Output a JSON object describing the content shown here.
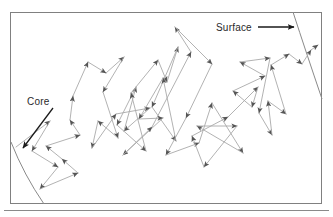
{
  "figure": {
    "title": "",
    "caption": "",
    "type": "random-walk-diagram",
    "background_color": "#ffffff",
    "frame": {
      "name": "outer-frame",
      "x": 10,
      "y": 12,
      "width": 312,
      "height": 192,
      "stroke": "#808080",
      "stroke_width": 1
    },
    "baseline_rule": {
      "name": "bottom-rule",
      "x1": 4,
      "y1": 210,
      "x2": 329,
      "y2": 210,
      "stroke": "#8a8a8a",
      "stroke_width": 1
    },
    "labels": [
      {
        "id": "core",
        "text": "Core",
        "x": 27,
        "y": 105,
        "color": "#2a2a2a",
        "font_size": 10
      },
      {
        "id": "surface",
        "text": "Surface",
        "x": 216,
        "y": 31,
        "color": "#2a2a2a",
        "font_size": 10
      }
    ],
    "leader_arrows": [
      {
        "id": "core-leader",
        "from": [
          53,
          108
        ],
        "to": [
          23,
          148
        ],
        "color": "#1a1a1a",
        "stroke_width": 1.3
      },
      {
        "id": "surface-leader",
        "from": [
          258,
          27
        ],
        "to": [
          294,
          27
        ],
        "color": "#1a1a1a",
        "stroke_width": 1.3
      }
    ],
    "arcs": [
      {
        "id": "core-boundary",
        "label": "Core",
        "path": "M 11,142 Q 24,175 44,204",
        "stroke": "#8a8a8a",
        "stroke_width": 1
      },
      {
        "id": "surface-boundary",
        "label": "Surface",
        "path": "M 293,12 Q 306,52 322,99",
        "stroke": "#8a8a8a",
        "stroke_width": 1
      }
    ],
    "walk": {
      "id": "photon-random-walk",
      "stroke": "#a9a9a9",
      "stroke_width": 0.9,
      "arrowhead_color": "#555555",
      "start": [
        16,
        147
      ],
      "end": [
        318,
        45
      ],
      "points": [
        [
          16,
          147
        ],
        [
          50,
          121
        ],
        [
          32,
          151
        ],
        [
          58,
          167
        ],
        [
          40,
          189
        ],
        [
          78,
          173
        ],
        [
          62,
          159
        ],
        [
          46,
          146
        ],
        [
          80,
          135
        ],
        [
          70,
          120
        ],
        [
          73,
          96
        ],
        [
          88,
          62
        ],
        [
          106,
          73
        ],
        [
          124,
          57
        ],
        [
          103,
          92
        ],
        [
          118,
          138
        ],
        [
          98,
          121
        ],
        [
          92,
          148
        ],
        [
          116,
          114
        ],
        [
          150,
          108
        ],
        [
          124,
          131
        ],
        [
          136,
          87
        ],
        [
          117,
          125
        ],
        [
          146,
          151
        ],
        [
          131,
          93
        ],
        [
          158,
          60
        ],
        [
          167,
          82
        ],
        [
          178,
          47
        ],
        [
          152,
          107
        ],
        [
          176,
          141
        ],
        [
          163,
          78
        ],
        [
          139,
          119
        ],
        [
          163,
          118
        ],
        [
          123,
          155
        ],
        [
          152,
          127
        ],
        [
          191,
          52
        ],
        [
          175,
          27
        ],
        [
          212,
          64
        ],
        [
          186,
          118
        ],
        [
          166,
          155
        ],
        [
          199,
          143
        ],
        [
          212,
          103
        ],
        [
          243,
          153
        ],
        [
          197,
          126
        ],
        [
          237,
          126
        ],
        [
          204,
          167
        ],
        [
          192,
          136
        ],
        [
          228,
          117
        ],
        [
          258,
          87
        ],
        [
          252,
          107
        ],
        [
          233,
          91
        ],
        [
          265,
          76
        ],
        [
          240,
          62
        ],
        [
          270,
          58
        ],
        [
          259,
          113
        ],
        [
          272,
          135
        ],
        [
          268,
          101
        ],
        [
          286,
          114
        ],
        [
          271,
          65
        ],
        [
          289,
          54
        ],
        [
          302,
          64
        ],
        [
          311,
          50
        ],
        [
          318,
          45
        ]
      ]
    },
    "colors": {
      "line": "#a9a9a9",
      "arrow": "#555555",
      "frame": "#808080",
      "text": "#2a2a2a",
      "leader": "#1a1a1a"
    }
  }
}
